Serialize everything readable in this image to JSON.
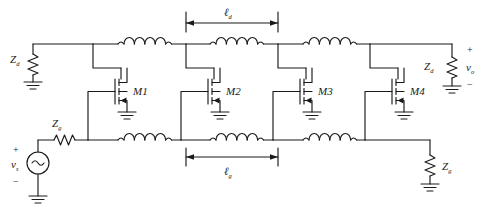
{
  "figure": {
    "type": "schematic",
    "stage_count": 4
  },
  "labels": {
    "zd_input": "Z",
    "zd_input_sub": "d",
    "zd_output": "Z",
    "zd_output_sub": "d",
    "zg_input": "Z",
    "zg_input_sub": "g",
    "zg_output": "Z",
    "zg_output_sub": "g",
    "vs": "v",
    "vs_sub": "s",
    "vo": "v",
    "vo_sub": "o",
    "plus_source": "+",
    "minus_source": "−",
    "plus_out": "+",
    "minus_out": "−",
    "ld": "ℓ",
    "ld_sub": "d",
    "lg": "ℓ",
    "lg_sub": "g"
  },
  "transistors": [
    {
      "name": "M1",
      "label": "M",
      "index": "1"
    },
    {
      "name": "M2",
      "label": "M",
      "index": "2"
    },
    {
      "name": "M3",
      "label": "M",
      "index": "3"
    },
    {
      "name": "M4",
      "label": "M",
      "index": "4"
    }
  ],
  "drain_line": {
    "name": "drain-transmission-line",
    "inductor_count": 3,
    "terminations": [
      "Z_d source end",
      "Z_d load end"
    ],
    "section_length_label": "ℓ_d"
  },
  "gate_line": {
    "name": "gate-transmission-line",
    "inductor_count": 3,
    "terminations": [
      "v_s with Z_g",
      "Z_g termination"
    ],
    "section_length_label": "ℓ_g"
  },
  "colors": {
    "line": "#1a1a1a",
    "text": "#1a1a1a",
    "background": "#ffffff"
  }
}
